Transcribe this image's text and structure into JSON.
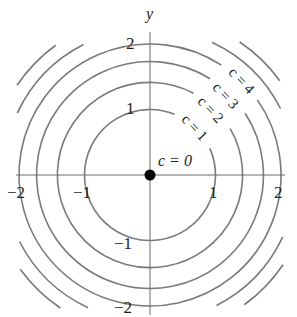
{
  "chart_data": {
    "type": "contour",
    "title": "",
    "function": "f(x, y) = x^2 + y^2",
    "xlabel": "",
    "ylabel": "y",
    "xlim": [
      -2.05,
      2.05
    ],
    "ylim": [
      -2.05,
      2.1
    ],
    "x_ticks": [
      -2,
      -1,
      1,
      2
    ],
    "x_tick_labels": [
      "−2",
      "−1",
      "1",
      "2"
    ],
    "y_ticks": [
      -2,
      -1,
      1,
      2
    ],
    "y_tick_labels": [
      "−2",
      "−1",
      "1",
      "2"
    ],
    "levels": [
      {
        "c": 0,
        "radius": 0,
        "label": "c = 0",
        "shape": "point"
      },
      {
        "c": 1,
        "radius": 1,
        "label": "c = 1"
      },
      {
        "c": 2,
        "radius": 1.414,
        "label": "c = 2"
      },
      {
        "c": 3,
        "radius": 1.732,
        "label": "c = 3"
      },
      {
        "c": 4,
        "radius": 2,
        "label": "c = 4"
      },
      {
        "c": 5,
        "radius": 2.236,
        "label": "",
        "partial": true
      },
      {
        "c": 6,
        "radius": 2.449,
        "label": "",
        "partial": true
      }
    ],
    "grid": false,
    "legend": "none"
  },
  "colors": {
    "curve": "#7a7a7a",
    "axis": "#6a6a6a",
    "text": "#222222",
    "point": "#000000"
  },
  "labels": {
    "y_axis": "y",
    "c0": "c = 0",
    "c1": "c = 1",
    "c2": "c = 2",
    "c3": "c = 3",
    "c4": "c = 4",
    "xt_m2": "−2",
    "xt_m1": "−1",
    "xt_1": "1",
    "xt_2": "2",
    "yt_2": "2",
    "yt_1": "1",
    "yt_m1": "−1",
    "yt_m2": "−2"
  }
}
